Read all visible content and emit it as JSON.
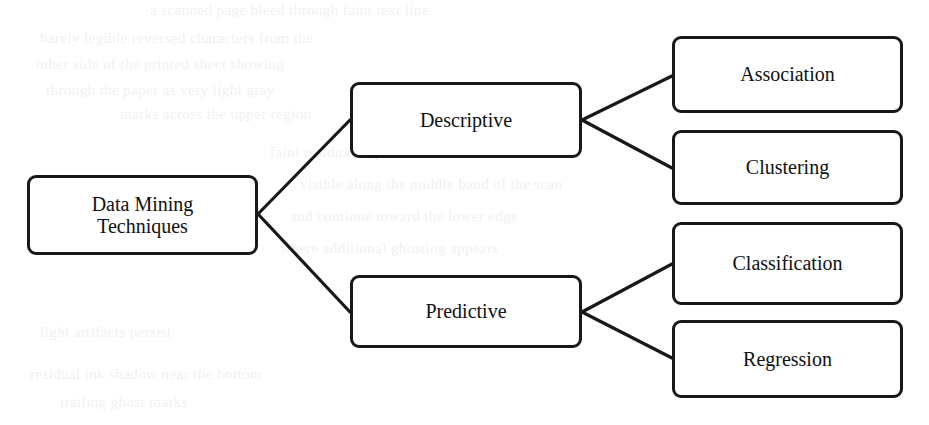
{
  "diagram": {
    "type": "tree-hierarchy",
    "orientation": "left-to-right",
    "style": {
      "node_border_color": "#17181a",
      "node_fill_color": "#ffffff",
      "connector_color": "#17181a",
      "background_color": "#ffffff",
      "ghost_text_color": "#f0f0f0"
    },
    "nodes": [
      {
        "id": "root",
        "label": "Data Mining\nTechniques",
        "label_line1": "Data Mining",
        "label_line2": "Techniques",
        "level": 0,
        "x": 27,
        "y": 175,
        "w": 231,
        "h": 80
      },
      {
        "id": "descriptive",
        "label": "Descriptive",
        "level": 1,
        "x": 350,
        "y": 82,
        "w": 232,
        "h": 76
      },
      {
        "id": "predictive",
        "label": "Predictive",
        "level": 1,
        "x": 350,
        "y": 275,
        "w": 232,
        "h": 73
      },
      {
        "id": "association",
        "label": "Association",
        "level": 2,
        "x": 672,
        "y": 36,
        "w": 231,
        "h": 77
      },
      {
        "id": "clustering",
        "label": "Clustering",
        "level": 2,
        "x": 672,
        "y": 130,
        "w": 231,
        "h": 75
      },
      {
        "id": "classification",
        "label": "Classification",
        "level": 2,
        "x": 672,
        "y": 222,
        "w": 231,
        "h": 83
      },
      {
        "id": "regression",
        "label": "Regression",
        "level": 2,
        "x": 672,
        "y": 320,
        "w": 231,
        "h": 78
      }
    ],
    "edges": [
      {
        "id": "root-descriptive",
        "from": "root",
        "to": "descriptive",
        "x1": 258,
        "y1": 214,
        "x2": 350,
        "y2": 120
      },
      {
        "id": "root-predictive",
        "from": "root",
        "to": "predictive",
        "x1": 258,
        "y1": 214,
        "x2": 350,
        "y2": 312
      },
      {
        "id": "descriptive-association",
        "from": "descriptive",
        "to": "association",
        "x1": 582,
        "y1": 120,
        "x2": 672,
        "y2": 76
      },
      {
        "id": "descriptive-clustering",
        "from": "descriptive",
        "to": "clustering",
        "x1": 582,
        "y1": 120,
        "x2": 672,
        "y2": 168
      },
      {
        "id": "predictive-classification",
        "from": "predictive",
        "to": "classification",
        "x1": 582,
        "y1": 312,
        "x2": 672,
        "y2": 264
      },
      {
        "id": "predictive-regression",
        "from": "predictive",
        "to": "regression",
        "x1": 582,
        "y1": 312,
        "x2": 672,
        "y2": 358
      }
    ],
    "background_ghost_text": [
      {
        "text": "a scanned page bleed through faint text line",
        "x": 150,
        "y": 8
      },
      {
        "text": "barely legible reversed characters from the",
        "x": 40,
        "y": 36
      },
      {
        "text": "other side of the printed sheet showing",
        "x": 36,
        "y": 62
      },
      {
        "text": "through the paper as very light gray",
        "x": 46,
        "y": 88
      },
      {
        "text": "marks across the upper region",
        "x": 120,
        "y": 112
      },
      {
        "text": "faint residual impressions remain",
        "x": 270,
        "y": 150
      },
      {
        "text": "visible along the middle band of the scan",
        "x": 300,
        "y": 182
      },
      {
        "text": "and continue toward the lower edge",
        "x": 290,
        "y": 214
      },
      {
        "text": "where additional ghosting appears",
        "x": 280,
        "y": 246
      },
      {
        "text": "light artifacts persist",
        "x": 40,
        "y": 330
      },
      {
        "text": "residual ink shadow near the bottom",
        "x": 30,
        "y": 372
      },
      {
        "text": "trailing ghost marks",
        "x": 60,
        "y": 400
      }
    ]
  }
}
